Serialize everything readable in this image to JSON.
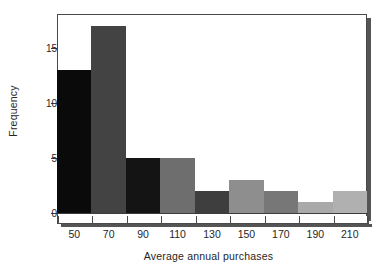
{
  "chart_data": {
    "type": "bar",
    "title": "",
    "subtitle": "",
    "xlabel": "Average annual purchases",
    "ylabel": "Frequency",
    "categories": [
      "50",
      "70",
      "90",
      "110",
      "130",
      "150",
      "170",
      "190",
      "210"
    ],
    "values": [
      13,
      17,
      5,
      5,
      2,
      3,
      2,
      1,
      2
    ],
    "bin_width": 20,
    "bin_edges": [
      40,
      60,
      80,
      100,
      120,
      140,
      160,
      180,
      200,
      220
    ],
    "series": [
      {
        "name": "Frequency",
        "values": [
          13,
          17,
          5,
          5,
          2,
          3,
          2,
          1,
          2
        ]
      }
    ],
    "bar_colors": [
      "#0a0a0a",
      "#434343",
      "#141414",
      "#6e6e6e",
      "#3e3e3e",
      "#8e8e8e",
      "#777777",
      "#a9a9a9",
      "#b0b0b0"
    ],
    "xlim": [
      40,
      220
    ],
    "ylim": [
      0,
      18
    ],
    "yticks": [
      0,
      5,
      10,
      15
    ],
    "ytick_labels": [
      "0",
      "5",
      "10",
      "15"
    ],
    "xticks": [
      50,
      70,
      90,
      110,
      130,
      150,
      170,
      190,
      210
    ],
    "xtick_labels": [
      "50",
      "70",
      "90",
      "110",
      "130",
      "150",
      "170",
      "190",
      "210"
    ],
    "grid": false,
    "legend": false,
    "legend_position": "none",
    "frame": true,
    "annotations": []
  },
  "colors": {
    "axis": "#3c3c3c",
    "frame": "#4a4a4a",
    "shadow": "#555555",
    "background": "#ffffff",
    "text": "#262626"
  }
}
